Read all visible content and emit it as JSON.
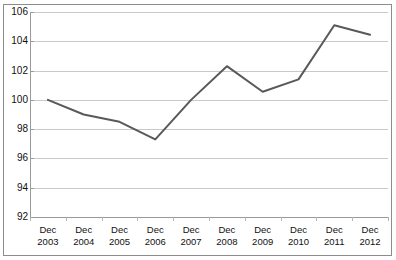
{
  "chart_data": {
    "type": "line",
    "title": "",
    "subtitle": "",
    "xlabel": "",
    "ylabel": "",
    "categories": [
      "Dec 2003",
      "Dec 2004",
      "Dec 2005",
      "Dec 2006",
      "Dec 2007",
      "Dec 2008",
      "Dec 2009",
      "Dec 2010",
      "Dec 2011",
      "Dec 2012"
    ],
    "category_lines": [
      [
        "Dec",
        "2003"
      ],
      [
        "Dec",
        "2004"
      ],
      [
        "Dec",
        "2005"
      ],
      [
        "Dec",
        "2006"
      ],
      [
        "Dec",
        "2007"
      ],
      [
        "Dec",
        "2008"
      ],
      [
        "Dec",
        "2009"
      ],
      [
        "Dec",
        "2010"
      ],
      [
        "Dec",
        "2011"
      ],
      [
        "Dec",
        "2012"
      ]
    ],
    "values": [
      100.0,
      99.0,
      98.5,
      97.3,
      100.0,
      102.3,
      100.55,
      101.4,
      105.1,
      104.45
    ],
    "ylim": [
      92,
      106
    ],
    "ytick_labels": [
      "106",
      "104",
      "102",
      "100",
      "98",
      "96",
      "94",
      "92"
    ],
    "ytick_values": [
      106,
      104,
      102,
      100,
      98,
      96,
      94,
      92
    ],
    "grid": true,
    "legend": false,
    "legend_position": "none",
    "series": [
      {
        "name": "Index",
        "values": [
          100.0,
          99.0,
          98.5,
          97.3,
          100.0,
          102.3,
          100.55,
          101.4,
          105.1,
          104.45
        ]
      }
    ],
    "colors": {
      "line": "#595959",
      "gridline": "#c9c9c9",
      "axis": "#9a9a9a",
      "border": "#8c8c8c",
      "background": "#ffffff",
      "text": "#111111"
    }
  }
}
